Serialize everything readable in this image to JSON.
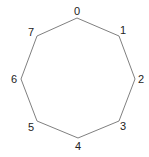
{
  "diagram": {
    "type": "octagon-graph",
    "stroke_color": "#808080",
    "label_color": "#222222",
    "vertices": [
      {
        "id": "0",
        "x": 77,
        "y": 18,
        "lx": 77,
        "ly": 15
      },
      {
        "id": "1",
        "x": 119,
        "y": 36,
        "lx": 123,
        "ly": 34
      },
      {
        "id": "2",
        "x": 135,
        "y": 79,
        "lx": 141,
        "ly": 83
      },
      {
        "id": "3",
        "x": 119,
        "y": 121,
        "lx": 123,
        "ly": 130
      },
      {
        "id": "4",
        "x": 78,
        "y": 138,
        "lx": 78,
        "ly": 150
      },
      {
        "id": "5",
        "x": 37,
        "y": 121,
        "lx": 31,
        "ly": 131
      },
      {
        "id": "6",
        "x": 21,
        "y": 79,
        "lx": 14,
        "ly": 83
      },
      {
        "id": "7",
        "x": 37,
        "y": 36,
        "lx": 31,
        "ly": 36
      }
    ]
  }
}
